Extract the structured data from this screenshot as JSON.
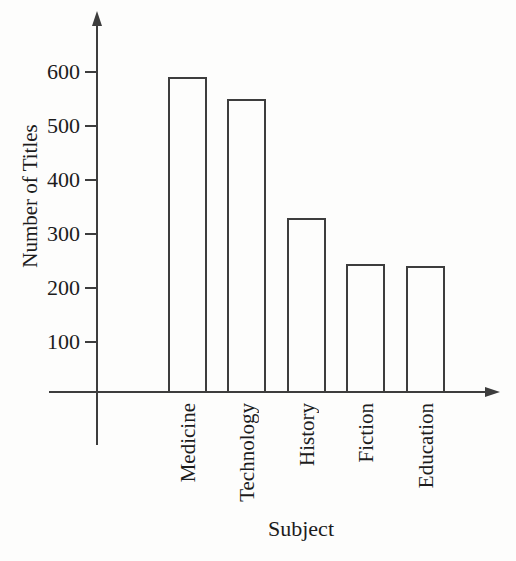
{
  "chart_data": {
    "type": "bar",
    "title": "",
    "categories": [
      "Medicine",
      "Technology",
      "History",
      "Fiction",
      "Education"
    ],
    "values": [
      590,
      550,
      330,
      245,
      240
    ],
    "xlabel": "Subject",
    "ylabel": "Number of Titles",
    "yticks": [
      100,
      200,
      300,
      400,
      500,
      600
    ],
    "ylim": [
      0,
      700
    ],
    "grid": false,
    "legend": "none",
    "bar_outline_only": true,
    "colors": {
      "background": "#fdfdfc",
      "ink": "#3d3d3d",
      "text": "#1c1c1c",
      "bar_fill": "#fdfdfc"
    }
  }
}
